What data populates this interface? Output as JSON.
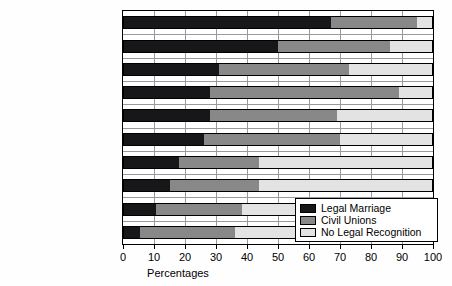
{
  "chart_data": {
    "type": "bar",
    "orientation": "horizontal",
    "stacked": true,
    "stacked_mode": "percent",
    "title": "",
    "xlabel": "Percentages",
    "ylabel": "",
    "xlim": [
      0,
      100
    ],
    "xticks": [
      0,
      10,
      20,
      30,
      40,
      50,
      60,
      70,
      80,
      90,
      100
    ],
    "xticklabels": [
      "0",
      "10",
      "20",
      "30",
      "40",
      "50",
      "60",
      "70",
      "80",
      "90",
      "100"
    ],
    "grid": "vertical",
    "legend_position": "inside-lower-right",
    "categories": [
      "Jewish",
      "Seculars",
      "Mainline Protestants",
      "Muslim",
      "Hispanic Catholics",
      "Catholics",
      "Hispanic Protestants",
      "Black Protestants",
      "Latter-Day Saints",
      "Evangelical Protestants"
    ],
    "series": [
      {
        "name": "Legal Marriage",
        "color": "#17171a",
        "values": [
          67,
          50,
          31,
          28,
          28,
          26,
          18,
          15,
          10.5,
          5.5
        ]
      },
      {
        "name": "Civil Unions",
        "color": "#888888",
        "values": [
          28,
          36,
          42,
          61,
          41,
          44,
          26,
          29,
          28,
          30.5
        ]
      },
      {
        "name": "No Legal Recognition",
        "color": "#e3e3e3",
        "values": [
          5,
          14,
          27,
          11,
          31,
          30,
          56,
          56,
          61.5,
          64
        ]
      }
    ]
  },
  "legend": {
    "items": [
      {
        "label": "Legal Marriage"
      },
      {
        "label": "Civil Unions"
      },
      {
        "label": "No Legal Recognition"
      }
    ]
  }
}
